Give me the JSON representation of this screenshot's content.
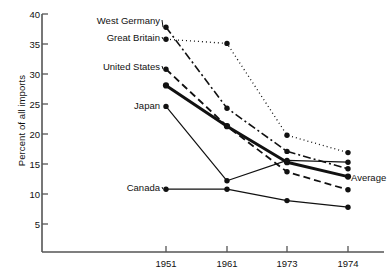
{
  "chart_data": {
    "type": "line",
    "title": "",
    "subtitle": "",
    "xlabel": "",
    "ylabel": "Percent of all imports",
    "x": [
      "1951",
      "1961",
      "1973",
      "1974"
    ],
    "categories": [
      "1951",
      "1961",
      "1973",
      "1974"
    ],
    "xtick_labels": [
      "1951",
      "1961",
      "1973",
      "1974"
    ],
    "ytick_labels": [
      "5",
      "10",
      "15",
      "20",
      "25",
      "30",
      "35",
      "40"
    ],
    "ytick_values": [
      5,
      10,
      15,
      20,
      25,
      30,
      35,
      40
    ],
    "ylim": [
      0,
      40
    ],
    "grid": false,
    "legend_position": "inline-labels",
    "series": [
      {
        "name": "West Germany",
        "label": "West Germany",
        "values": [
          37.8,
          24.3,
          17.1,
          14.2
        ],
        "line_style": "dash-dot",
        "line_width": 1.6,
        "color": "#111111",
        "label_side": "left"
      },
      {
        "name": "Great Britain",
        "label": "Great Britain",
        "values": [
          35.8,
          35.1,
          19.8,
          16.9
        ],
        "line_style": "dotted",
        "line_width": 1.3,
        "color": "#111111",
        "label_side": "left"
      },
      {
        "name": "United States",
        "label": "United States",
        "values": [
          30.8,
          21.3,
          13.7,
          10.7
        ],
        "line_style": "dashed",
        "line_width": 1.8,
        "color": "#111111",
        "label_side": "left"
      },
      {
        "name": "Average",
        "label": "Average",
        "values": [
          28.1,
          21.3,
          15.3,
          12.9
        ],
        "line_style": "solid",
        "line_width": 3.0,
        "color": "#111111",
        "label_side": "right"
      },
      {
        "name": "Japan",
        "label": "Japan",
        "values": [
          24.6,
          12.2,
          15.6,
          15.3
        ],
        "line_style": "solid",
        "line_width": 1.2,
        "color": "#111111",
        "label_side": "left"
      },
      {
        "name": "Canada",
        "label": "Canada",
        "values": [
          10.8,
          10.8,
          8.9,
          7.8
        ],
        "line_style": "solid",
        "line_width": 1.2,
        "color": "#111111",
        "label_side": "left"
      }
    ],
    "axis_color": "#555555",
    "marker": "filled-circle"
  },
  "labels": {
    "y_axis_title": "Percent of all imports",
    "west_germany": "West Germany",
    "great_britain": "Great Britain",
    "united_states": "United States",
    "japan": "Japan",
    "canada": "Canada",
    "average": "Average",
    "y_5": "5",
    "y_10": "10",
    "y_15": "15",
    "y_20": "20",
    "y_25": "25",
    "y_30": "30",
    "y_35": "35",
    "y_40": "40",
    "x_1951": "1951",
    "x_1961": "1961",
    "x_1973": "1973",
    "x_1974": "1974"
  }
}
